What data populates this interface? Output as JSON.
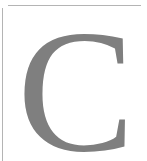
{
  "glyph": {
    "letter": "C",
    "color": "#7f7f7f"
  },
  "frame": {
    "rule_color": "#b4b4b4",
    "background": "#ffffff"
  }
}
